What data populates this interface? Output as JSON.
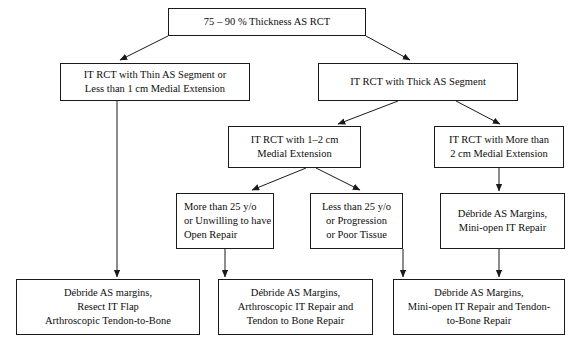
{
  "diagram": {
    "type": "flowchart",
    "background_color": "#ffffff",
    "line_color": "#1a1a1a",
    "text_color": "#0d0d0d",
    "nodes": [
      {
        "id": "root",
        "lines": [
          "75 – 90 % Thickness AS RCT"
        ],
        "align": "center"
      },
      {
        "id": "thin",
        "lines": [
          "IT RCT with Thin AS Segment or",
          "Less than 1 cm Medial Extension"
        ],
        "align": "center"
      },
      {
        "id": "thick",
        "lines": [
          "IT RCT with Thick AS Segment"
        ],
        "align": "center"
      },
      {
        "id": "one_two_cm",
        "lines": [
          "IT RCT with 1–2 cm",
          "Medial Extension"
        ],
        "align": "center"
      },
      {
        "id": "more_two_cm",
        "lines": [
          "IT RCT with More than",
          "2 cm Medial Extension"
        ],
        "align": "center"
      },
      {
        "id": "more_25",
        "lines": [
          "More than 25 y/o",
          "or Unwilling to have",
          "Open Repair"
        ],
        "align": "left"
      },
      {
        "id": "less_25",
        "lines": [
          "Less than 25 y/o",
          "or Progression",
          "or Poor Tissue"
        ],
        "align": "center"
      },
      {
        "id": "debride_mini",
        "lines": [
          "Débride AS Margins,",
          "Mini-open IT Repair"
        ],
        "align": "center"
      },
      {
        "id": "outcome_left",
        "lines": [
          "Débride AS margins,",
          "Resect IT Flap",
          "Arthroscopic Tendon-to-Bone"
        ],
        "align": "center"
      },
      {
        "id": "outcome_middle",
        "lines": [
          "Débride AS Margins,",
          "Arthroscopic IT Repair and",
          "Tendon to Bone Repair"
        ],
        "align": "center"
      },
      {
        "id": "outcome_right",
        "lines": [
          "Débride AS Margins,",
          "Mini-open IT Repair and Tendon-",
          "to-Bone Repair"
        ],
        "align": "center"
      }
    ]
  }
}
